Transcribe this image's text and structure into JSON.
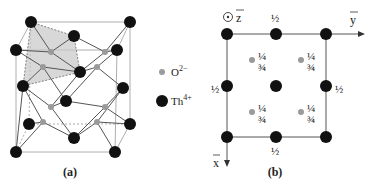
{
  "figure": {
    "panel_a": {
      "caption": "(a)",
      "legend": [
        {
          "name": "oxygen",
          "label": "O",
          "charge": "2−",
          "color": "#9a9a9a"
        },
        {
          "name": "thorium",
          "label": "Th",
          "charge": "4+",
          "color": "#111111"
        }
      ]
    },
    "panel_b": {
      "caption": "(b)",
      "axis_z": "z",
      "axis_y": "y",
      "axis_x": "x",
      "half": "½",
      "quarter": "¼",
      "three_quarter": "¾"
    }
  },
  "colors": {
    "thorium": "#111111",
    "oxygen": "#9a9a9a",
    "lines": "#666666",
    "polyhedron": "#bdbdbd"
  }
}
